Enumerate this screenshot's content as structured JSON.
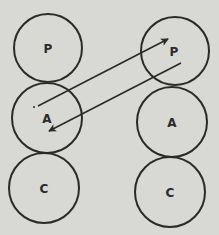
{
  "diagram": {
    "left_column": [
      {
        "label": "P",
        "cx": 48,
        "cy": 48,
        "r": 34
      },
      {
        "label": "A",
        "cx": 47,
        "cy": 118,
        "r": 35
      },
      {
        "label": "C",
        "cx": 44,
        "cy": 188,
        "r": 35
      }
    ],
    "right_column": [
      {
        "label": "P",
        "cx": 175,
        "cy": 51,
        "r": 34
      },
      {
        "label": "A",
        "cx": 172,
        "cy": 122,
        "r": 35
      },
      {
        "label": "C",
        "cx": 170,
        "cy": 192,
        "r": 35
      }
    ],
    "arrows": [
      {
        "from": "left-A",
        "to": "right-P",
        "x1": 38,
        "y1": 106,
        "x2": 168,
        "y2": 39
      },
      {
        "from": "right-P",
        "to": "left-A",
        "x1": 181,
        "y1": 63,
        "x2": 49,
        "y2": 131
      }
    ],
    "colors": {
      "background": "#d8d8d4",
      "stroke": "#2a2a2a"
    }
  }
}
